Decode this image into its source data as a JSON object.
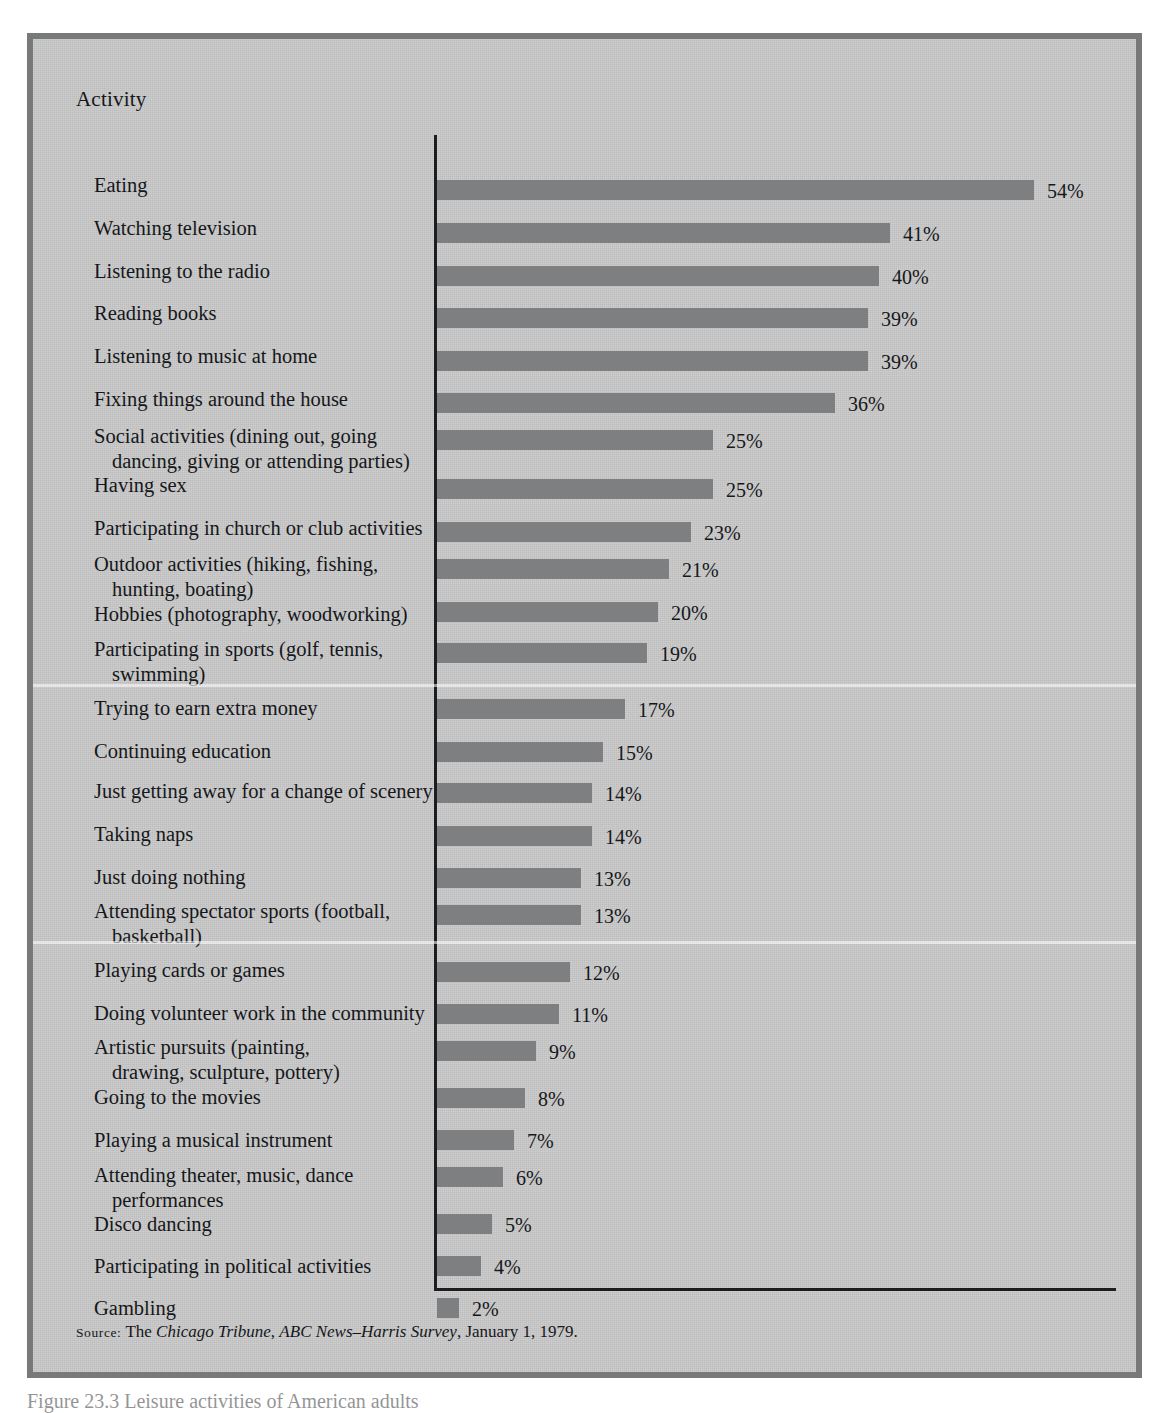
{
  "figure": {
    "column_heading": "Activity",
    "caption": "Figure 23.3   Leisure activities of American adults",
    "top_bleed_text": "percentage of adults naming each as a favorite"
  },
  "source": {
    "label": "Source:",
    "prefix": "The ",
    "publication": "Chicago Tribune",
    "separator1": ", ",
    "survey": "ABC News–Harris Survey",
    "suffix": ", January 1, 1979."
  },
  "colors": {
    "page_background": "#ffffff",
    "panel_background": "#c9c9c9",
    "panel_border": "#77797b",
    "bar_fill": "#7d7f81",
    "axis": "#1b1d20",
    "text": "#15171a"
  },
  "chart_data": {
    "type": "bar",
    "orientation": "horizontal",
    "title": "Leisure activities of American adults",
    "xlabel": "",
    "ylabel": "Activity",
    "xlim": [
      0,
      54
    ],
    "grid": false,
    "legend": null,
    "value_suffix": "%",
    "categories": [
      "Eating",
      "Watching television",
      "Listening to the radio",
      "Reading books",
      "Listening to music at home",
      "Fixing things around the house",
      "Social activities (dining out, going\ndancing, giving or attending parties)",
      "Having sex",
      "Participating in church or club activities",
      "Outdoor activities (hiking, fishing,\nhunting, boating)",
      "Hobbies (photography, woodworking)",
      "Participating in sports (golf, tennis,\nswimming)",
      "Trying to earn extra money",
      "Continuing education",
      "Just getting away for a change of scenery",
      "Taking naps",
      "Just doing nothing",
      "Attending spectator sports (football,\nbasketball)",
      "Playing cards or games",
      "Doing volunteer work in the community",
      "Artistic pursuits (painting,\ndrawing, sculpture, pottery)",
      "Going to the movies",
      "Playing a musical instrument",
      "Attending theater, music, dance\nperformances",
      "Disco dancing",
      "Participating in political activities",
      "Gambling"
    ],
    "values": [
      54,
      41,
      40,
      39,
      39,
      36,
      25,
      25,
      23,
      21,
      20,
      19,
      17,
      15,
      14,
      14,
      13,
      13,
      12,
      11,
      9,
      8,
      7,
      6,
      5,
      4,
      2
    ],
    "value_labels": [
      "54%",
      "41%",
      "40%",
      "39%",
      "39%",
      "36%",
      "25%",
      "25%",
      "23%",
      "21%",
      "20%",
      "19%",
      "17%",
      "15%",
      "14%",
      "14%",
      "13%",
      "13%",
      "12%",
      "11%",
      "9%",
      "8%",
      "7%",
      "6%",
      "5%",
      "4%",
      "2%"
    ]
  },
  "layout": {
    "bar_origin_x": 404,
    "px_per_percent": 11.05,
    "bar_height": 20,
    "rows": [
      {
        "label_top": 134,
        "bar_top": 141,
        "multiline": false
      },
      {
        "label_top": 177,
        "bar_top": 184,
        "multiline": false
      },
      {
        "label_top": 220,
        "bar_top": 227,
        "multiline": false
      },
      {
        "label_top": 262,
        "bar_top": 269,
        "multiline": false
      },
      {
        "label_top": 305,
        "bar_top": 312,
        "multiline": false
      },
      {
        "label_top": 348,
        "bar_top": 354,
        "multiline": false
      },
      {
        "label_top": 385,
        "bar_top": 391,
        "multiline": true
      },
      {
        "label_top": 434,
        "bar_top": 440,
        "multiline": false
      },
      {
        "label_top": 477,
        "bar_top": 483,
        "multiline": false
      },
      {
        "label_top": 513,
        "bar_top": 520,
        "multiline": true
      },
      {
        "label_top": 563,
        "bar_top": 563,
        "multiline": false
      },
      {
        "label_top": 598,
        "bar_top": 604,
        "multiline": true
      },
      {
        "label_top": 657,
        "bar_top": 660,
        "multiline": false
      },
      {
        "label_top": 700,
        "bar_top": 703,
        "multiline": false
      },
      {
        "label_top": 740,
        "bar_top": 744,
        "multiline": false
      },
      {
        "label_top": 783,
        "bar_top": 787,
        "multiline": false
      },
      {
        "label_top": 826,
        "bar_top": 829,
        "multiline": false
      },
      {
        "label_top": 860,
        "bar_top": 866,
        "multiline": true
      },
      {
        "label_top": 919,
        "bar_top": 923,
        "multiline": false
      },
      {
        "label_top": 962,
        "bar_top": 965,
        "multiller": false,
        "multiline": false
      },
      {
        "label_top": 996,
        "bar_top": 1002,
        "multiline": true
      },
      {
        "label_top": 1046,
        "bar_top": 1049,
        "multiline": false
      },
      {
        "label_top": 1089,
        "bar_top": 1091,
        "multiline": false
      },
      {
        "label_top": 1124,
        "bar_top": 1128,
        "multiline": true
      },
      {
        "label_top": 1173,
        "bar_top": 1175,
        "multiline": false
      },
      {
        "label_top": 1215,
        "bar_top": 1217,
        "multiline": false
      },
      {
        "label_top": 1257,
        "bar_top": 1259,
        "multiline": false
      }
    ],
    "scan_bands": [
      645,
      902
    ]
  }
}
